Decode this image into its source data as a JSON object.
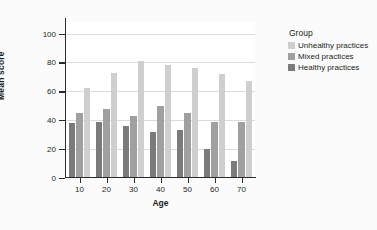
{
  "chart_data": {
    "type": "bar",
    "title": "",
    "subtitle": "",
    "xlabel": "Age",
    "ylabel": "Mean score",
    "categories": [
      "10",
      "20",
      "30",
      "40",
      "50",
      "60",
      "70"
    ],
    "series": [
      {
        "name": "Healthy practices",
        "color": "#7b7b7b",
        "values": [
          38,
          38.5,
          36,
          32,
          33,
          20,
          12
        ]
      },
      {
        "name": "Mixed practices",
        "color": "#a0a0a0",
        "values": [
          45,
          47.5,
          43,
          50,
          45,
          38.5,
          38.5
        ]
      },
      {
        "name": "Unhealthy practices",
        "color": "#cfcfcf",
        "values": [
          62.5,
          73,
          81,
          78.5,
          76,
          72,
          67
        ]
      }
    ],
    "legend": {
      "title": "Group",
      "position": "right",
      "entries": [
        "Unhealthy practices",
        "Mixed practices",
        "Healthy practices"
      ]
    },
    "ylim": [
      0,
      108
    ],
    "yticks": [
      0,
      20,
      40,
      60,
      80,
      100
    ],
    "ytick_labels": [
      "0",
      "20",
      "40",
      "60",
      "80",
      "100"
    ],
    "grid": true,
    "grid_axis": "y",
    "colors": {
      "unhealthy": "#cfcfcf",
      "mixed": "#a0a0a0",
      "healthy": "#7b7b7b",
      "grid": "#dcdcdc",
      "axis": "#2b2b2b",
      "text": "#231f20",
      "plot_background": "#ffffff",
      "figure_background": "#fbfbfb"
    }
  }
}
